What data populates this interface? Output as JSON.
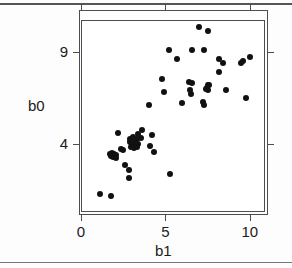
{
  "figure": {
    "axis_title_y": "b0",
    "axis_title_x": "b1",
    "point_color": "#111111",
    "frame_color": "#4d4d4d"
  },
  "chart_data": {
    "type": "scatter",
    "title": "",
    "xlabel": "b1",
    "ylabel": "b0",
    "xlim": [
      0,
      10.9
    ],
    "ylim": [
      0.35,
      10.7
    ],
    "xticks": [
      0,
      5,
      10
    ],
    "xticklabels": [
      "0",
      "5",
      "10"
    ],
    "yticks": [
      4,
      9
    ],
    "yticklabels": [
      "4",
      "9"
    ],
    "grid": false,
    "legend": null,
    "marker": "filled-circle",
    "n_points": 62,
    "points": [
      {
        "x": 7.0,
        "y": 10.3
      },
      {
        "x": 7.5,
        "y": 10.1
      },
      {
        "x": 5.2,
        "y": 9.1
      },
      {
        "x": 6.6,
        "y": 9.1
      },
      {
        "x": 7.3,
        "y": 9.1
      },
      {
        "x": 5.7,
        "y": 8.6
      },
      {
        "x": 8.2,
        "y": 8.6
      },
      {
        "x": 8.4,
        "y": 8.4
      },
      {
        "x": 9.6,
        "y": 8.5
      },
      {
        "x": 10.0,
        "y": 8.7
      },
      {
        "x": 8.2,
        "y": 7.9
      },
      {
        "x": 4.8,
        "y": 7.5
      },
      {
        "x": 6.6,
        "y": 7.3
      },
      {
        "x": 7.5,
        "y": 7.2
      },
      {
        "x": 7.6,
        "y": 7.2
      },
      {
        "x": 4.9,
        "y": 6.8
      },
      {
        "x": 6.5,
        "y": 6.7
      },
      {
        "x": 7.4,
        "y": 7.0
      },
      {
        "x": 7.5,
        "y": 6.9
      },
      {
        "x": 8.6,
        "y": 6.9
      },
      {
        "x": 9.8,
        "y": 6.5
      },
      {
        "x": 6.0,
        "y": 6.2
      },
      {
        "x": 7.2,
        "y": 6.3
      },
      {
        "x": 7.3,
        "y": 6.1
      },
      {
        "x": 4.0,
        "y": 6.1
      },
      {
        "x": 2.2,
        "y": 4.6
      },
      {
        "x": 4.2,
        "y": 4.5
      },
      {
        "x": 2.9,
        "y": 4.3
      },
      {
        "x": 3.1,
        "y": 4.4
      },
      {
        "x": 3.3,
        "y": 4.3
      },
      {
        "x": 2.9,
        "y": 4.1
      },
      {
        "x": 3.0,
        "y": 4.0
      },
      {
        "x": 3.1,
        "y": 4.0
      },
      {
        "x": 3.2,
        "y": 4.1
      },
      {
        "x": 3.4,
        "y": 4.0
      },
      {
        "x": 2.95,
        "y": 3.85
      },
      {
        "x": 3.15,
        "y": 3.8
      },
      {
        "x": 3.3,
        "y": 3.85
      },
      {
        "x": 4.1,
        "y": 3.9
      },
      {
        "x": 4.3,
        "y": 3.6
      },
      {
        "x": 2.5,
        "y": 3.7
      },
      {
        "x": 1.7,
        "y": 3.5
      },
      {
        "x": 1.85,
        "y": 3.55
      },
      {
        "x": 1.95,
        "y": 3.45
      },
      {
        "x": 2.1,
        "y": 3.4
      },
      {
        "x": 1.75,
        "y": 3.35
      },
      {
        "x": 1.9,
        "y": 3.3
      },
      {
        "x": 2.05,
        "y": 3.25
      },
      {
        "x": 2.6,
        "y": 2.9
      },
      {
        "x": 2.85,
        "y": 2.6
      },
      {
        "x": 2.85,
        "y": 2.2
      },
      {
        "x": 5.3,
        "y": 2.4
      },
      {
        "x": 1.1,
        "y": 1.3
      },
      {
        "x": 1.8,
        "y": 1.2
      },
      {
        "x": 3.6,
        "y": 4.75
      },
      {
        "x": 3.55,
        "y": 4.35
      },
      {
        "x": 6.4,
        "y": 7.35
      },
      {
        "x": 6.45,
        "y": 6.95
      },
      {
        "x": 7.45,
        "y": 7.05
      },
      {
        "x": 2.35,
        "y": 3.75
      },
      {
        "x": 3.35,
        "y": 4.55
      },
      {
        "x": 9.5,
        "y": 8.4
      }
    ]
  }
}
